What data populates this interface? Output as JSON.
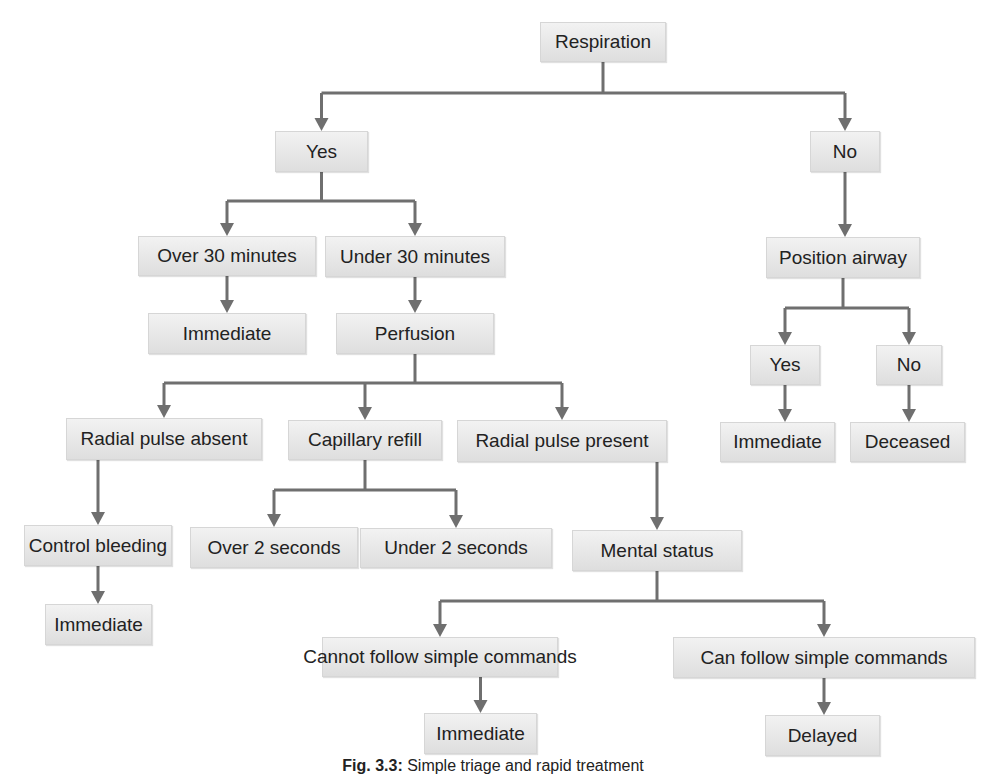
{
  "colors": {
    "box_fill": "#e6e6e6",
    "connector": "#6f6f6f",
    "text": "#222222"
  },
  "diagram": {
    "type": "flowchart",
    "nodes": [
      {
        "id": "respiration",
        "label": "Respiration",
        "x": 540,
        "y": 22,
        "w": 126,
        "h": 40
      },
      {
        "id": "yes1",
        "label": "Yes",
        "x": 275,
        "y": 131,
        "w": 93,
        "h": 41
      },
      {
        "id": "no1",
        "label": "No",
        "x": 810,
        "y": 131,
        "w": 70,
        "h": 41
      },
      {
        "id": "over30",
        "label": "Over 30 minutes",
        "x": 138,
        "y": 236,
        "w": 178,
        "h": 40
      },
      {
        "id": "under30",
        "label": "Under 30 minutes",
        "x": 325,
        "y": 236,
        "w": 180,
        "h": 41
      },
      {
        "id": "immediate1",
        "label": "Immediate",
        "x": 148,
        "y": 313,
        "w": 158,
        "h": 41
      },
      {
        "id": "perfusion",
        "label": "Perfusion",
        "x": 336,
        "y": 313,
        "w": 158,
        "h": 41
      },
      {
        "id": "position_airway",
        "label": "Position airway",
        "x": 766,
        "y": 237,
        "w": 154,
        "h": 41
      },
      {
        "id": "yes2",
        "label": "Yes",
        "x": 750,
        "y": 345,
        "w": 70,
        "h": 40
      },
      {
        "id": "no2",
        "label": "No",
        "x": 876,
        "y": 345,
        "w": 66,
        "h": 40
      },
      {
        "id": "immediate2",
        "label": "Immediate",
        "x": 720,
        "y": 422,
        "w": 115,
        "h": 40
      },
      {
        "id": "deceased",
        "label": "Deceased",
        "x": 850,
        "y": 422,
        "w": 115,
        "h": 40
      },
      {
        "id": "radial_absent",
        "label": "Radial pulse absent",
        "x": 66,
        "y": 418,
        "w": 196,
        "h": 42
      },
      {
        "id": "capillary_refill",
        "label": "Capillary refill",
        "x": 288,
        "y": 420,
        "w": 154,
        "h": 40
      },
      {
        "id": "radial_present",
        "label": "Radial pulse present",
        "x": 457,
        "y": 420,
        "w": 210,
        "h": 42
      },
      {
        "id": "control_bleeding",
        "label": "Control bleeding",
        "x": 24,
        "y": 525,
        "w": 148,
        "h": 41
      },
      {
        "id": "over2",
        "label": "Over 2 seconds",
        "x": 190,
        "y": 527,
        "w": 168,
        "h": 41
      },
      {
        "id": "under2",
        "label": "Under 2 seconds",
        "x": 360,
        "y": 528,
        "w": 192,
        "h": 40
      },
      {
        "id": "mental_status",
        "label": "Mental status",
        "x": 572,
        "y": 530,
        "w": 170,
        "h": 41
      },
      {
        "id": "immediate3",
        "label": "Immediate",
        "x": 45,
        "y": 604,
        "w": 107,
        "h": 41
      },
      {
        "id": "cannot_follow",
        "label": "Cannot follow simple commands",
        "x": 322,
        "y": 637,
        "w": 236,
        "h": 40
      },
      {
        "id": "can_follow",
        "label": "Can follow simple commands",
        "x": 673,
        "y": 637,
        "w": 302,
        "h": 41
      },
      {
        "id": "immediate4",
        "label": "Immediate",
        "x": 424,
        "y": 713,
        "w": 113,
        "h": 41
      },
      {
        "id": "delayed",
        "label": "Delayed",
        "x": 765,
        "y": 715,
        "w": 115,
        "h": 41
      }
    ],
    "edges": [
      [
        "respiration",
        "yes1"
      ],
      [
        "respiration",
        "no1"
      ],
      [
        "yes1",
        "over30"
      ],
      [
        "yes1",
        "under30"
      ],
      [
        "over30",
        "immediate1"
      ],
      [
        "under30",
        "perfusion"
      ],
      [
        "no1",
        "position_airway"
      ],
      [
        "position_airway",
        "yes2"
      ],
      [
        "position_airway",
        "no2"
      ],
      [
        "yes2",
        "immediate2"
      ],
      [
        "no2",
        "deceased"
      ],
      [
        "perfusion",
        "radial_absent"
      ],
      [
        "perfusion",
        "capillary_refill"
      ],
      [
        "perfusion",
        "radial_present"
      ],
      [
        "radial_absent",
        "control_bleeding"
      ],
      [
        "control_bleeding",
        "immediate3"
      ],
      [
        "capillary_refill",
        "over2"
      ],
      [
        "capillary_refill",
        "under2"
      ],
      [
        "radial_present",
        "mental_status"
      ],
      [
        "mental_status",
        "cannot_follow"
      ],
      [
        "mental_status",
        "can_follow"
      ],
      [
        "cannot_follow",
        "immediate4"
      ],
      [
        "can_follow",
        "delayed"
      ]
    ]
  },
  "caption": {
    "fig_label": "Fig. 3.3:",
    "text": "Simple triage and rapid treatment"
  }
}
